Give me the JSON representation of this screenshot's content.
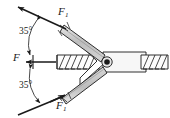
{
  "figure": {
    "type": "mechanics-free-body-diagram",
    "background_color": "#ffffff",
    "line_color": "#1a1a1a",
    "arm_fill_color": "#c9c9c9",
    "arm_fill_light": "#e2e2e2",
    "body_fill_color": "#f2f2f2",
    "pivot_color": "#1a1a1a",
    "labels": {
      "force_top": {
        "symbol": "F",
        "subscript": "1"
      },
      "force_bottom": {
        "symbol": "F",
        "subscript": "1"
      },
      "force_center": {
        "symbol": "F",
        "subscript": ""
      },
      "angle_top": "35°",
      "angle_bottom": "35°"
    },
    "angles": {
      "top_degrees": 35,
      "bottom_degrees": 35,
      "included_degrees": 70
    },
    "vectors": [
      {
        "name": "F1-upper",
        "direction": "up-left along 35° above horizontal",
        "label": "F1"
      },
      {
        "name": "F-center",
        "direction": "left along horizontal",
        "label": "F"
      },
      {
        "name": "F1-lower",
        "direction": "down-left along 35° below horizontal",
        "label": "F1"
      }
    ]
  }
}
